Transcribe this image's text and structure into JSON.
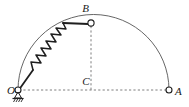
{
  "figure": {
    "type": "mechanics-diagram",
    "title": "",
    "background_color": "#ffffff",
    "stroke_color": "#2b2b2b",
    "arc_color": "#555555",
    "dashed_color": "#777777",
    "width": 189,
    "height": 107,
    "labels": {
      "origin": "O",
      "top": "B",
      "center": "C",
      "right": "A"
    },
    "points": {
      "O": {
        "x": 18,
        "y": 90,
        "label": "O",
        "marker": "open-circle",
        "support": "pin-hinge-hatched-ground"
      },
      "B": {
        "x": 91,
        "y": 23,
        "label": "B",
        "marker": "open-circle"
      },
      "C": {
        "x": 91,
        "y": 90,
        "label": "C",
        "marker": "none"
      },
      "A": {
        "x": 169,
        "y": 90,
        "label": "A",
        "marker": "open-circle"
      }
    },
    "elements": {
      "semicircle_arc": {
        "name": "semicircular-wire-arc",
        "center_x": 93.5,
        "center_y": 90,
        "radius": 75.5,
        "style": "solid-thin"
      },
      "baseline": {
        "name": "horizontal-dashed-baseline",
        "from": "O",
        "to": "A",
        "style": "dashed"
      },
      "vertical": {
        "name": "vertical-dashed-line",
        "from": "B",
        "to": "C",
        "style": "dashed"
      },
      "spring": {
        "name": "coil-spring",
        "from": "O",
        "to": "B",
        "coils": 7,
        "style": "zigzag"
      },
      "rod_lower": {
        "name": "rod-segment-lower",
        "from": "O",
        "to": "spring-start"
      },
      "rod_upper": {
        "name": "rod-segment-upper",
        "from": "spring-end",
        "to": "B"
      },
      "ground_support": {
        "name": "ground-hatching",
        "x": 18,
        "y": 97
      }
    }
  }
}
